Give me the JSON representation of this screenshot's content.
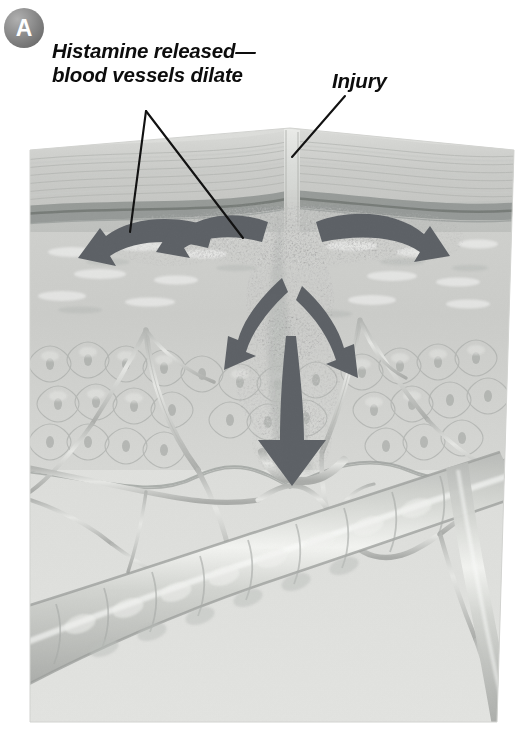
{
  "figure": {
    "panel_label": "A",
    "panel_badge_color": "#7c7c7c",
    "background_color": "#ffffff"
  },
  "labels": {
    "histamine": {
      "line1": "Histamine released—",
      "line2": "blood vessels dilate",
      "text_color": "#0d0d0d",
      "style": "bold-italic"
    },
    "injury": {
      "text": "Injury",
      "text_color": "#0d0d0d",
      "style": "bold-italic"
    }
  },
  "leader_lines": [
    {
      "name": "histamine-leader-left",
      "from": [
        146,
        111
      ],
      "to": [
        130,
        232
      ]
    },
    {
      "name": "histamine-leader-right",
      "from": [
        146,
        111
      ],
      "to": [
        243,
        238
      ]
    },
    {
      "name": "injury-leader",
      "from": [
        345,
        96
      ],
      "to": [
        292,
        157
      ]
    }
  ],
  "arrows": {
    "color": "#5d6166",
    "count": 6,
    "items": [
      {
        "name": "arrow-outward-far-left",
        "direction": "left-down"
      },
      {
        "name": "arrow-outward-left",
        "direction": "left-down"
      },
      {
        "name": "arrow-outward-right",
        "direction": "right-down"
      },
      {
        "name": "arrow-deep-left",
        "direction": "left-down"
      },
      {
        "name": "arrow-deep-right",
        "direction": "right-down"
      },
      {
        "name": "arrow-deep-center",
        "direction": "down"
      }
    ]
  },
  "skin_layers": [
    {
      "name": "stratum-corneum",
      "tone": "#cfd0cd"
    },
    {
      "name": "epidermis",
      "tone": "#c2c4c1"
    },
    {
      "name": "basement-band",
      "tone": "#8e9390"
    },
    {
      "name": "dermis-upper",
      "tone": "#cdcecb"
    },
    {
      "name": "dermis-cellular",
      "tone": "#c9cac7"
    },
    {
      "name": "subcutaneous",
      "tone": "#dadbd8"
    }
  ],
  "anatomy": {
    "wound_channel": "vertical-puncture-through-epidermis",
    "histamine_cloud": "speckled-diffusion-around-wound",
    "large_vessel": "dilated-blood-vessel-diagonal",
    "capillary_network": "branching-capillaries"
  }
}
